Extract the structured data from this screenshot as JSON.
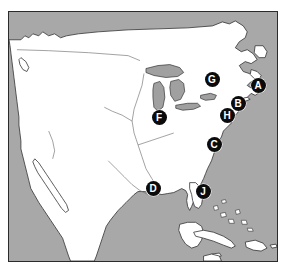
{
  "figure": {
    "kind": "reference-map",
    "region_title": "North America",
    "frame": {
      "x": 8,
      "y": 11,
      "width": 270,
      "height": 251
    }
  },
  "colors": {
    "ocean": "#a8a8a8",
    "land": "#ffffff",
    "lakes": "#a0a0a0",
    "coastline": "#333333",
    "border_line": "#2b2b2b",
    "marker_fill": "#0b0b0b",
    "marker_text": "#ffffff",
    "page_background": "#ffffff"
  },
  "markers": [
    {
      "label": "A",
      "x": 258,
      "y": 85,
      "name": "marker-a"
    },
    {
      "label": "G",
      "x": 212,
      "y": 79,
      "name": "marker-g"
    },
    {
      "label": "B",
      "x": 238,
      "y": 103,
      "name": "marker-b"
    },
    {
      "label": "H",
      "x": 227,
      "y": 115,
      "name": "marker-h"
    },
    {
      "label": "F",
      "x": 159,
      "y": 117,
      "name": "marker-f"
    },
    {
      "label": "C",
      "x": 214,
      "y": 144,
      "name": "marker-c"
    },
    {
      "label": "D",
      "x": 153,
      "y": 188,
      "name": "marker-d"
    },
    {
      "label": "J",
      "x": 203,
      "y": 191,
      "name": "marker-j"
    }
  ]
}
